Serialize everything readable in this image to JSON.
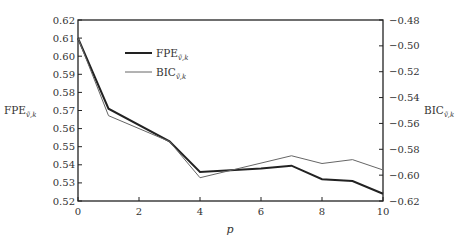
{
  "chart_data": {
    "type": "line",
    "title": "",
    "xlabel": "p",
    "ylabel": "FPE_{v,k}",
    "ylabel_right": "BIC_{v,k}",
    "x": [
      0,
      1,
      3,
      4,
      6,
      7,
      8,
      9,
      10
    ],
    "xticks": [
      0,
      2,
      4,
      6,
      8,
      10
    ],
    "xlim": [
      0,
      10
    ],
    "ylim": [
      0.52,
      0.62
    ],
    "yticks": [
      "0.52",
      "0.53",
      "0.54",
      "0.55",
      "0.56",
      "0.57",
      "0.58",
      "0.59",
      "0.60",
      "0.61",
      "0.62"
    ],
    "ylim_right": [
      -0.62,
      -0.48
    ],
    "yticks_right": [
      "-0.62",
      "-0.60",
      "-0.58",
      "-0.56",
      "-0.54",
      "-0.52",
      "-0.50",
      "-0.48"
    ],
    "series": [
      {
        "name": "FPE_{v,k}",
        "axis": "left",
        "style": "thick",
        "x": [
          0,
          1,
          3,
          4,
          6,
          7,
          8,
          9,
          10
        ],
        "values": [
          0.61,
          0.571,
          0.553,
          0.536,
          0.538,
          0.5395,
          0.532,
          0.531,
          0.524
        ]
      },
      {
        "name": "BIC_{v,k}",
        "axis": "right",
        "style": "thin",
        "x": [
          0,
          1,
          3,
          4,
          7,
          8,
          9,
          10
        ],
        "values": [
          -0.494,
          -0.554,
          -0.574,
          -0.602,
          -0.585,
          -0.591,
          -0.588,
          -0.596
        ]
      }
    ],
    "legend_position": "upper-left-inside",
    "grid": false
  }
}
